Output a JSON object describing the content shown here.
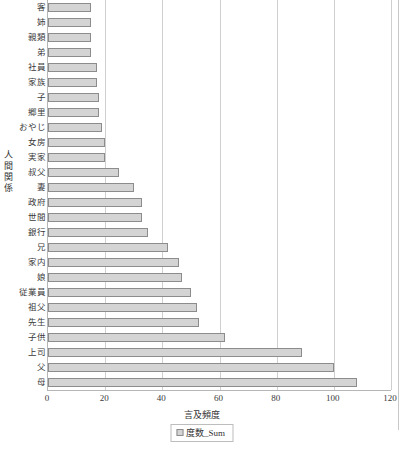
{
  "chart_data": {
    "type": "bar",
    "orientation": "horizontal",
    "title": "",
    "xlabel": "言及頻度",
    "ylabel": "人間関係",
    "xlim": [
      0,
      120
    ],
    "xticks": [
      "0",
      "20",
      "40",
      "60",
      "80",
      "100",
      "120"
    ],
    "grid": true,
    "legend_position": "bottom",
    "legend": [
      "度数_Sum"
    ],
    "series_name": "度数_Sum",
    "bar_color": "#d4d4d4",
    "bar_border_color": "#8c8c8c",
    "categories": [
      "客",
      "姉",
      "親類",
      "弟",
      "社員",
      "家族",
      "子",
      "郷里",
      "おやじ",
      "女房",
      "実家",
      "叔父",
      "妻",
      "政府",
      "世間",
      "銀行",
      "兄",
      "家内",
      "娘",
      "従業員",
      "祖父",
      "先生",
      "子供",
      "上司",
      "父",
      "母"
    ],
    "values": [
      15,
      15,
      15,
      15,
      17,
      17,
      18,
      18,
      19,
      20,
      20,
      25,
      30,
      33,
      33,
      35,
      42,
      46,
      47,
      50,
      52,
      53,
      62,
      89,
      100,
      108
    ]
  },
  "legend": {
    "series_label": "度数_Sum"
  },
  "bottom_caption": ""
}
